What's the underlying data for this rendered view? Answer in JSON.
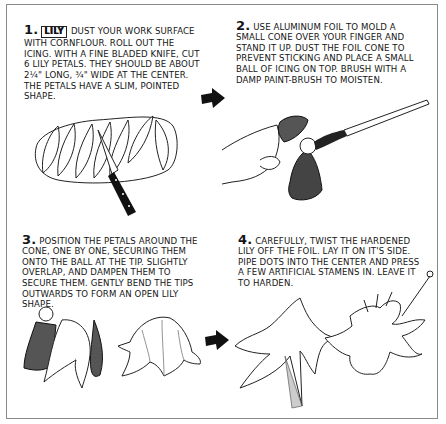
{
  "frame": {
    "border_color": "#8a8a8a",
    "background": "#ffffff"
  },
  "steps": [
    {
      "number": "1.",
      "badge": "LILY",
      "text": "Dust your work surface with cornflour. Roll out the icing. With a fine bladed knife, cut 6 lily petals. They should be about 2¼\" long, ¾\" wide at the center. The petals have a slim, pointed shape.",
      "illustration": "knife-cutting-lily-petals-from-rolled-icing"
    },
    {
      "number": "2.",
      "text": "Use aluminum foil to mold a small cone over your finger and stand it up. Dust the foil cone to prevent sticking and place a small ball of icing on top. Brush with a damp paint-brush to moisten.",
      "illustration": "hand-molding-foil-cone-and-brush"
    },
    {
      "number": "3.",
      "text": "Position the petals around the cone, one by one, securing them onto the ball at the tip. Slightly overlap, and dampen them to secure them. Gently bend the tips outwards to form an open lily shape.",
      "illustration": "petals-on-foil-cone-and-bell-shape"
    },
    {
      "number": "4.",
      "text": "Carefully, twist the hardened lily off the foil. Lay it on it's side. Pipe dots into the center and press a few artificial stamens in. Leave it to harden.",
      "illustration": "twisting-lily-off-foil-and-finished-lily-with-stamens"
    }
  ],
  "arrows": [
    {
      "icon": "right-arrow-icon",
      "from_step": 1,
      "to_step": 2
    },
    {
      "icon": "right-arrow-icon",
      "from_step": 3,
      "to_step": 4
    }
  ]
}
